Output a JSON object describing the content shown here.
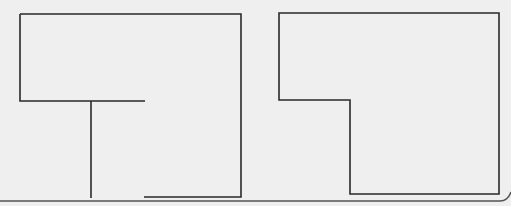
{
  "diagram": {
    "background": "#efefef",
    "stroke_color": "#2a2a2a",
    "stroke_width": 1.6,
    "page_border_color": "#555555",
    "shapes": [
      {
        "name": "left-shape",
        "paths": [
          "M20,14 L241,14 L241,197 L144,197",
          "M20,14 L20,101 L145,101",
          "M91,101 L91,198"
        ]
      },
      {
        "name": "right-shape",
        "paths": [
          "M279,13 L499,13 L499,194 L350,194 L350,100 L279,100 Z"
        ]
      }
    ],
    "page_border_path": "M0,201 L500,201 Q508,201 511,192"
  }
}
